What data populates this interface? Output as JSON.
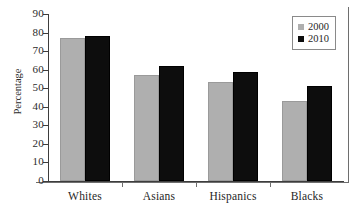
{
  "chart_data": {
    "type": "bar",
    "title": "",
    "xlabel": "",
    "ylabel": "Percentage",
    "categories": [
      "Whites",
      "Asians",
      "Hispanics",
      "Blacks"
    ],
    "series": [
      {
        "name": "2000",
        "color": "#afafaf",
        "values": [
          77,
          57,
          53.5,
          43
        ]
      },
      {
        "name": "2010",
        "color": "#0d0d0d",
        "values": [
          78,
          62,
          59,
          51
        ]
      }
    ],
    "ylim": [
      0,
      90
    ],
    "ytick_step": 10,
    "ytick_labels": [
      "90",
      "80",
      "70",
      "60",
      "50",
      "40",
      "30",
      "20",
      "10",
      "0"
    ],
    "grid": false,
    "legend_position": "top-right",
    "legend_entries": [
      "2000",
      "2010"
    ]
  },
  "figure": {
    "frame": "right-bottom-rule",
    "background_color": "#ffffff",
    "axis_color": "#3d3d3d"
  }
}
